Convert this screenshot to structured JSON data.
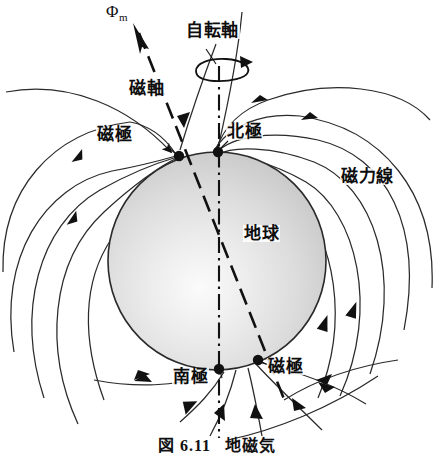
{
  "figure": {
    "caption_prefix": "図",
    "caption_number": "6.11",
    "caption_title": "地磁気",
    "caption_full": "図 6.11  地磁気"
  },
  "labels": {
    "magnetic_flux": "Φm",
    "magnetic_flux_base": "Φ",
    "magnetic_flux_sub": "m",
    "rotation_axis": "自転軸",
    "magnetic_axis": "磁軸",
    "magnetic_pole_north": "磁極",
    "magnetic_pole_south": "磁極",
    "geographic_north_pole": "北極",
    "geographic_south_pole": "南極",
    "earth": "地球",
    "field_lines": "磁力線"
  },
  "colors": {
    "stroke": "#1a1a1a",
    "earth_fill_light": "#f2f2f2",
    "earth_fill_mid": "#d9d9d9",
    "earth_fill_dark": "#bdbdbd",
    "background": "#ffffff"
  },
  "geometry": {
    "earth_center_x": 217,
    "earth_center_y": 261,
    "earth_radius": 109,
    "rotation_axis_tilt_deg": 0,
    "magnetic_axis_tilt_deg": 18
  },
  "diagram": {
    "type": "geomagnetic-field-diagram",
    "poles": [
      {
        "name": "geographic-north-pole",
        "label": "北極",
        "x": 218,
        "y": 152
      },
      {
        "name": "magnetic-north-pole",
        "label": "磁極",
        "x": 179,
        "y": 156
      },
      {
        "name": "geographic-south-pole",
        "label": "南極",
        "x": 219,
        "y": 369
      },
      {
        "name": "magnetic-south-pole",
        "label": "磁極",
        "x": 258,
        "y": 360
      }
    ]
  }
}
